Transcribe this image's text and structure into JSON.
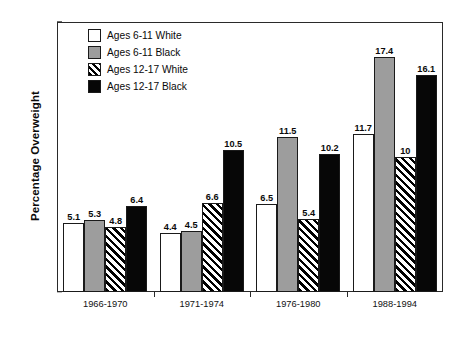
{
  "chart_data": {
    "type": "bar",
    "title": "",
    "xlabel": "",
    "ylabel": "Percentage Overweight",
    "ylim": [
      0,
      20
    ],
    "yticks": [
      0,
      2,
      4,
      6,
      8,
      10,
      12,
      14,
      16,
      18,
      20
    ],
    "grid": false,
    "legend_position": "top-left",
    "categories": [
      "1966-1970",
      "1971-1974",
      "1976-1980",
      "1988-1994"
    ],
    "series": [
      {
        "name": "Ages  6-11 White",
        "fill": "white",
        "values": [
          5.1,
          4.4,
          6.5,
          11.7
        ],
        "labels": [
          "5.1",
          "4.4",
          "6.5",
          "11.7"
        ]
      },
      {
        "name": "Ages 6-11 Black",
        "fill": "gray",
        "values": [
          5.3,
          4.5,
          11.5,
          17.4
        ],
        "labels": [
          "5.3",
          "4.5",
          "11.5",
          "17.4"
        ]
      },
      {
        "name": "Ages 12-17 White",
        "fill": "hatch",
        "values": [
          4.8,
          6.6,
          5.4,
          10.0
        ],
        "labels": [
          "4.8",
          "6.6",
          "5.4",
          "10"
        ]
      },
      {
        "name": "Ages 12-17 Black",
        "fill": "black",
        "values": [
          6.4,
          10.5,
          10.2,
          16.1
        ],
        "labels": [
          "6.4",
          "10.5",
          "10.2",
          "16.1"
        ]
      }
    ]
  },
  "axis": {
    "y_title": "Percentage Overweight",
    "y_tick_labels": [
      "0",
      "2",
      "4",
      "6",
      "8",
      "10",
      "12",
      "14",
      "16",
      "18",
      "20"
    ],
    "x_tick_labels": [
      "1966-1970",
      "1971-1974",
      "1976-1980",
      "1988-1994"
    ]
  },
  "legend": {
    "items": [
      {
        "label": "Ages  6-11 White",
        "fill": "white"
      },
      {
        "label": "Ages 6-11 Black",
        "fill": "gray"
      },
      {
        "label": "Ages 12-17 White",
        "fill": "hatch"
      },
      {
        "label": "Ages 12-17 Black",
        "fill": "black"
      }
    ]
  },
  "colors": {
    "white_fill": "#ffffff",
    "gray_fill": "#9d9d9d",
    "black_fill": "#070707",
    "outline": "#1a1a1a",
    "axis": "#2a2a2a"
  }
}
